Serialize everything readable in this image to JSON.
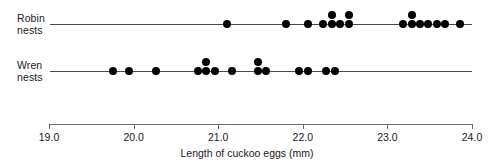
{
  "chart_data": {
    "type": "scatter",
    "subtype": "dotplot",
    "title": "",
    "xlabel": "Length of cuckoo eggs (mm)",
    "ylabel": "",
    "xlim": [
      19.0,
      24.0
    ],
    "xticks": [
      19.0,
      20.0,
      21.0,
      22.0,
      23.0,
      24.0
    ],
    "xtick_labels": [
      "19.0",
      "20.0",
      "21.0",
      "22.0",
      "23.0",
      "24.0"
    ],
    "grid": false,
    "legend": false,
    "dot_color": "#000000",
    "axis_color": "#4a4a4a",
    "series": [
      {
        "name": "Robin nests",
        "label_lines": [
          "Robin",
          "nests"
        ],
        "count": 21,
        "values": [
          21.1,
          21.8,
          22.06,
          22.24,
          22.35,
          22.35,
          22.44,
          22.55,
          22.55,
          23.19,
          23.29,
          23.29,
          23.38,
          23.48,
          23.59,
          23.68,
          23.86,
          22.24,
          22.44,
          23.19,
          23.48
        ],
        "stacks": [
          {
            "value": 21.1,
            "n": 1
          },
          {
            "value": 21.8,
            "n": 1
          },
          {
            "value": 22.06,
            "n": 1
          },
          {
            "value": 22.24,
            "n": 1
          },
          {
            "value": 22.35,
            "n": 2
          },
          {
            "value": 22.44,
            "n": 1
          },
          {
            "value": 22.55,
            "n": 2
          },
          {
            "value": 23.19,
            "n": 1
          },
          {
            "value": 23.29,
            "n": 2
          },
          {
            "value": 23.38,
            "n": 1
          },
          {
            "value": 23.48,
            "n": 1
          },
          {
            "value": 23.59,
            "n": 1
          },
          {
            "value": 23.68,
            "n": 1
          },
          {
            "value": 23.86,
            "n": 1
          }
        ]
      },
      {
        "name": "Wren nests",
        "label_lines": [
          "Wren",
          "nests"
        ],
        "count": 15,
        "stacks": [
          {
            "value": 19.76,
            "n": 1
          },
          {
            "value": 19.95,
            "n": 1
          },
          {
            "value": 20.26,
            "n": 1
          },
          {
            "value": 20.76,
            "n": 1
          },
          {
            "value": 20.86,
            "n": 2
          },
          {
            "value": 20.96,
            "n": 1
          },
          {
            "value": 21.16,
            "n": 1
          },
          {
            "value": 21.47,
            "n": 2
          },
          {
            "value": 21.56,
            "n": 1
          },
          {
            "value": 21.96,
            "n": 1
          },
          {
            "value": 22.06,
            "n": 1
          },
          {
            "value": 22.28,
            "n": 1
          },
          {
            "value": 22.38,
            "n": 1
          }
        ]
      }
    ]
  },
  "layout": {
    "x_left_px": 49,
    "x_right_px": 472,
    "px_per_unit": 84.6,
    "row_baselines_px": [
      24,
      71
    ],
    "line_start_px": 50,
    "line_end_px": 472,
    "scale_y_px": 124,
    "tick_height_px": 5,
    "tick_label_y_px": 131,
    "axis_title_y_px": 147,
    "dot_size_px": 8,
    "stack_offset_px": 9
  }
}
